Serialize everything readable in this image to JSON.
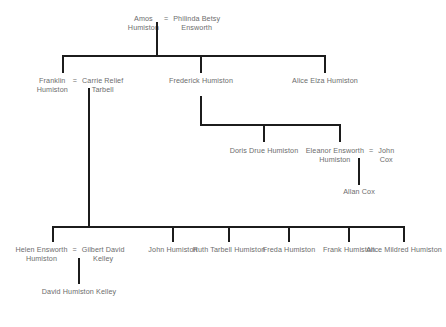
{
  "diagram": {
    "background_color": "#ffffff",
    "line_color": "#1c1c1c",
    "text_color": "#6d6d6d",
    "marriage_symbol": "=",
    "generations": [
      {
        "id": "gen1",
        "couples": [
          {
            "id": "amos-philinda",
            "left": {
              "line1": "Amos",
              "line2": "Humiston"
            },
            "right": {
              "line1": "Philinda Betsy",
              "line2": "Ensworth"
            }
          }
        ]
      },
      {
        "id": "gen2",
        "people": [
          {
            "id": "franklin",
            "line1": "Franklin",
            "line2": "Humiston"
          },
          {
            "id": "carrie",
            "line1": "Carrie Relief",
            "line2": "Tarbell"
          },
          {
            "id": "frederick",
            "line1": "Frederick",
            "line2": "Humiston"
          },
          {
            "id": "alice-elza",
            "line1": "Alice Elza",
            "line2": "Humiston"
          }
        ]
      },
      {
        "id": "gen3",
        "people": [
          {
            "id": "doris",
            "line1": "Doris Drue",
            "line2": "Humiston"
          },
          {
            "id": "eleanor",
            "line1": "Eleanor Ensworth",
            "line2": "Humiston"
          },
          {
            "id": "john-cox",
            "line1": "John",
            "line2": "Cox"
          },
          {
            "id": "allan-cox",
            "line1": "Allan",
            "line2": "Cox"
          }
        ]
      },
      {
        "id": "gen4",
        "people": [
          {
            "id": "helen",
            "line1": "Helen Ensworth",
            "line2": "Humiston"
          },
          {
            "id": "gilbert",
            "line1": "Gilbert David",
            "line2": "Kelley"
          },
          {
            "id": "john-humiston",
            "line1": "John",
            "line2": "Humiston"
          },
          {
            "id": "ruth",
            "line1": "Ruth Tarbell",
            "line2": "Humiston"
          },
          {
            "id": "freda",
            "line1": "Freda",
            "line2": "Humiston"
          },
          {
            "id": "frank",
            "line1": "Frank",
            "line2": "Humiston"
          },
          {
            "id": "alice-mildred",
            "line1": "Alice Mildred",
            "line2": "Humiston"
          }
        ]
      },
      {
        "id": "gen5",
        "people": [
          {
            "id": "david-kelley",
            "line1": "David Humiston",
            "line2": "Kelley"
          }
        ]
      }
    ]
  }
}
